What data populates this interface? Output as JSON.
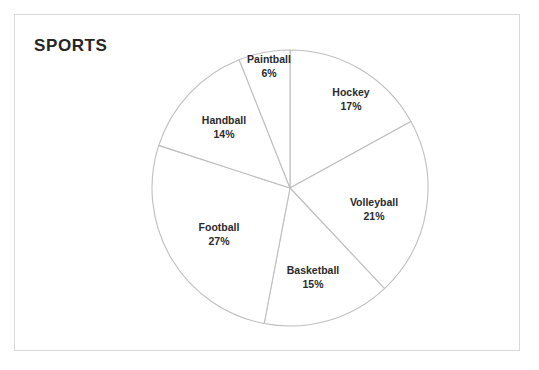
{
  "document": {
    "title": "SPORTS",
    "frame_color": "#d9d9d9",
    "background": "#ffffff"
  },
  "chart_data": {
    "type": "pie",
    "title": "SPORTS",
    "xlabel": "",
    "ylabel": "",
    "legend": "none",
    "labels_shown": "category name and percentage",
    "start_angle_deg": 0,
    "direction": "clockwise",
    "slice_fill": "#ffffff",
    "slice_stroke": "#bfbfbf",
    "categories": [
      "Hockey",
      "Volleyball",
      "Basketball",
      "Football",
      "Handball",
      "Paintball"
    ],
    "values": [
      17,
      21,
      15,
      27,
      14,
      6
    ],
    "unit": "%",
    "slices": [
      {
        "name": "Hockey",
        "percent": 17,
        "percent_label": "17%",
        "label_x": 351,
        "label_y": 99
      },
      {
        "name": "Volleyball",
        "percent": 21,
        "percent_label": "21%",
        "label_x": 374,
        "label_y": 209
      },
      {
        "name": "Basketball",
        "percent": 15,
        "percent_label": "15%",
        "label_x": 313,
        "label_y": 277
      },
      {
        "name": "Football",
        "percent": 27,
        "percent_label": "27%",
        "label_x": 219,
        "label_y": 234
      },
      {
        "name": "Handball",
        "percent": 14,
        "percent_label": "14%",
        "label_x": 224,
        "label_y": 127
      },
      {
        "name": "Paintball",
        "percent": 6,
        "percent_label": "6%",
        "label_x": 269,
        "label_y": 66
      }
    ],
    "geometry": {
      "center_x": 290,
      "center_y": 188,
      "radius": 138
    }
  }
}
